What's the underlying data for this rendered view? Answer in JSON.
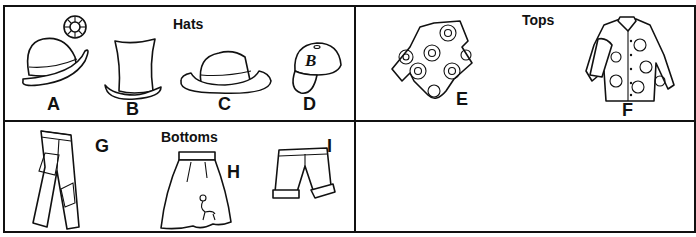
{
  "sections": {
    "hats": {
      "title": "Hats",
      "items": [
        {
          "label": "A",
          "name": "bowler hat with flower"
        },
        {
          "label": "B",
          "name": "top hat"
        },
        {
          "label": "C",
          "name": "fedora"
        },
        {
          "label": "D",
          "name": "baseball cap",
          "emblem": "B"
        }
      ]
    },
    "tops": {
      "title": "Tops",
      "items": [
        {
          "label": "E",
          "name": "short-sleeve flower-print shirt"
        },
        {
          "label": "F",
          "name": "long-sleeve polka-dot shirt"
        }
      ]
    },
    "bottoms": {
      "title": "Bottoms",
      "items": [
        {
          "label": "G",
          "name": "patched jeans"
        },
        {
          "label": "H",
          "name": "poodle skirt"
        },
        {
          "label": "I",
          "name": "shorts"
        }
      ]
    },
    "empty": {}
  }
}
